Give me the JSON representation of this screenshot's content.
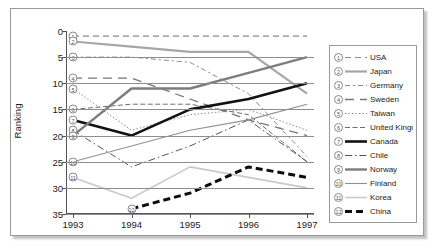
{
  "chart_data": {
    "type": "line",
    "title": "",
    "xlabel": "",
    "ylabel": "Ranking",
    "x": [
      1993,
      1994,
      1995,
      1996,
      1997
    ],
    "xtick_labels": [
      "1993",
      "1994",
      "1995",
      "1996",
      "1997"
    ],
    "ytick_labels": [
      "0",
      "5",
      "10",
      "15",
      "20",
      "25",
      "30",
      "35"
    ],
    "yticks": [
      0,
      5,
      10,
      15,
      20,
      25,
      30,
      35
    ],
    "ylim": [
      0,
      35
    ],
    "y_inverted": true,
    "grid": true,
    "legend_position": "right",
    "series": [
      {
        "number": "1",
        "name": "USA",
        "values": [
          1,
          1,
          1,
          1,
          1
        ],
        "style": "dashed",
        "color": "#8a8a8a",
        "width": 1.2
      },
      {
        "number": "2",
        "name": "Japan",
        "values": [
          2,
          3,
          4,
          4,
          12
        ],
        "style": "solid",
        "color": "#a6a6a6",
        "width": 2.2
      },
      {
        "number": "3",
        "name": "Germany",
        "values": [
          5,
          5,
          6,
          12,
          24
        ],
        "style": "dashed-long",
        "color": "#8a8a8a",
        "width": 1.0
      },
      {
        "number": "4",
        "name": "Sweden",
        "values": [
          9,
          9,
          13,
          17,
          20
        ],
        "style": "dashed-wide",
        "color": "#777777",
        "width": 1.3
      },
      {
        "number": "5",
        "name": "Taiwan",
        "values": [
          11,
          19,
          16,
          15,
          19
        ],
        "style": "dotted",
        "color": "#8a8a8a",
        "width": 1.0
      },
      {
        "number": "6",
        "name": "United Kingdom",
        "values": [
          15,
          14,
          14,
          16,
          25
        ],
        "style": "dash-dot",
        "color": "#6e6e6e",
        "width": 1.0
      },
      {
        "number": "7",
        "name": "Canada",
        "values": [
          17,
          20,
          15,
          13,
          10
        ],
        "style": "solid",
        "color": "#121212",
        "width": 2.6
      },
      {
        "number": "8",
        "name": "Chile",
        "values": [
          19,
          26,
          22,
          17,
          25
        ],
        "style": "dash-dot-2",
        "color": "#555555",
        "width": 1.0
      },
      {
        "number": "9",
        "name": "Norway",
        "values": [
          20,
          11,
          11,
          8,
          5
        ],
        "style": "solid",
        "color": "#7d7d7d",
        "width": 2.4
      },
      {
        "number": "10",
        "name": "Finland",
        "values": [
          25,
          22,
          19,
          17,
          14
        ],
        "style": "solid",
        "color": "#909090",
        "width": 1.1
      },
      {
        "number": "11",
        "name": "Korea",
        "values": [
          28,
          32,
          26,
          28,
          30
        ],
        "style": "solid",
        "color": "#c9c9c9",
        "width": 1.6
      },
      {
        "number": "12",
        "name": "China",
        "values": [
          null,
          34,
          31,
          26,
          28
        ],
        "style": "bold-dash",
        "color": "#0d0d0d",
        "width": 3.0
      }
    ],
    "axis_markers": [
      {
        "number": "1",
        "value": 1
      },
      {
        "number": "2",
        "value": 2
      },
      {
        "number": "3",
        "value": 5
      },
      {
        "number": "4",
        "value": 9
      },
      {
        "number": "5",
        "value": 11
      },
      {
        "number": "6",
        "value": 15
      },
      {
        "number": "7",
        "value": 17
      },
      {
        "number": "8",
        "value": 19
      },
      {
        "number": "9",
        "value": 20
      },
      {
        "number": "10",
        "value": 25
      },
      {
        "number": "11",
        "value": 28
      }
    ]
  }
}
